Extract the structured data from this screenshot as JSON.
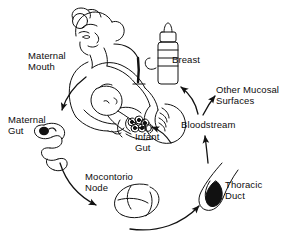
{
  "figure": {
    "type": "line-art-medical-diagram",
    "ink_color": "#111111",
    "background_color": "#ffffff",
    "width": 294,
    "height": 252
  },
  "labels": {
    "maternal_mouth": "Maternal\nMouth",
    "breast": "Breast",
    "other_mucosal_surfaces": "Other Mucosal\nSurfaces",
    "maternal_gut": "Maternal\nGut",
    "infant_gut": "Infant\nGut",
    "bloodstream": "Bloodstream",
    "mesenteric_node": "Mocontorio\nNode",
    "thoracic_duct": "Thoracic\nDuct"
  },
  "illustration": {
    "mother_figure": "mother-head-and-torso",
    "infant_figure": "infant-held-at-breast",
    "bottle": "feeding-bottle",
    "gut_organ": "maternal-gut-loop",
    "infant_gut_organ": "infant-gut-cluster",
    "node_organ": "mesenteric-node",
    "duct_organ": "thoracic-duct"
  },
  "arrows": [
    {
      "name": "mouth-to-maternal-gut",
      "from": "Maternal Mouth",
      "to": "Maternal Gut"
    },
    {
      "name": "maternal-gut-to-mesenteric-node",
      "from": "Maternal Gut",
      "to": "Mocontorio Node"
    },
    {
      "name": "mesenteric-node-to-thoracic-duct",
      "from": "Mocontorio Node",
      "to": "Thoracic Duct"
    },
    {
      "name": "thoracic-duct-to-bloodstream",
      "from": "Thoracic Duct",
      "to": "Bloodstream"
    },
    {
      "name": "bloodstream-to-other-mucosal-surfaces",
      "from": "Bloodstream",
      "to": "Other Mucosal Surfaces"
    },
    {
      "name": "bloodstream-to-breast",
      "from": "Bloodstream",
      "to": "Breast"
    },
    {
      "name": "breast-to-infant-gut",
      "from": "Breast",
      "to": "Infant Gut"
    }
  ]
}
